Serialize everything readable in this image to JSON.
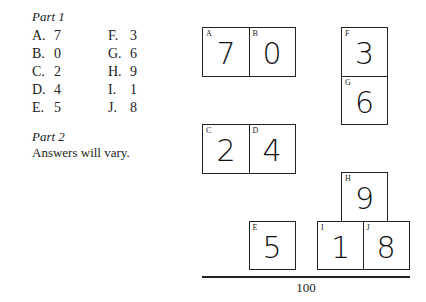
{
  "part1": {
    "title": "Part 1",
    "answers_left": [
      {
        "letter": "A.",
        "value": "7"
      },
      {
        "letter": "B.",
        "value": "0"
      },
      {
        "letter": "C.",
        "value": "2"
      },
      {
        "letter": "D.",
        "value": "4"
      },
      {
        "letter": "E.",
        "value": "5"
      }
    ],
    "answers_right": [
      {
        "letter": "F.",
        "value": "3"
      },
      {
        "letter": "G.",
        "value": "6"
      },
      {
        "letter": "H.",
        "value": "9"
      },
      {
        "letter": "I.",
        "value": "1"
      },
      {
        "letter": "J.",
        "value": "8"
      }
    ]
  },
  "part2": {
    "title": "Part 2",
    "text": "Answers will vary."
  },
  "puzzle": {
    "boxes": {
      "A": {
        "label": "A",
        "digit": "7"
      },
      "B": {
        "label": "B",
        "digit": "0"
      },
      "C": {
        "label": "C",
        "digit": "2"
      },
      "D": {
        "label": "D",
        "digit": "4"
      },
      "E": {
        "label": "E",
        "digit": "5"
      },
      "F": {
        "label": "F",
        "digit": "3"
      },
      "G": {
        "label": "G",
        "digit": "6"
      },
      "H": {
        "label": "H",
        "digit": "9"
      },
      "I": {
        "label": "I",
        "digit": "1"
      },
      "J": {
        "label": "J",
        "digit": "8"
      }
    },
    "total": "100"
  }
}
